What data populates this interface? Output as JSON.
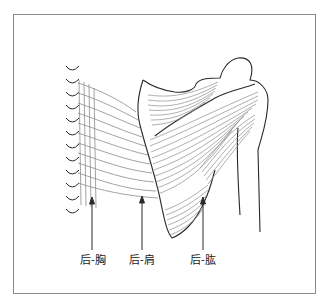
{
  "figure": {
    "type": "anatomical-diagram",
    "labels": [
      {
        "id": "chest",
        "text": "后-胸"
      },
      {
        "id": "shoulder",
        "text": "后-肩"
      },
      {
        "id": "upper-arm",
        "text": "后-肱"
      }
    ],
    "colors": {
      "outline": "#2a2a2a",
      "fibers": "#8c8c8c",
      "frame": "#8a8a8a",
      "background": "#ffffff"
    }
  }
}
